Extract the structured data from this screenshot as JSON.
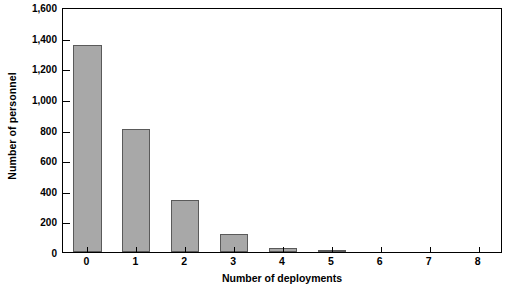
{
  "chart_data": {
    "type": "bar",
    "title": "",
    "subtitle": "",
    "xlabel": "Number of deployments",
    "ylabel": "Number of personnel",
    "categories": [
      "0",
      "1",
      "2",
      "3",
      "4",
      "5",
      "6",
      "7",
      "8"
    ],
    "values": [
      1350,
      805,
      340,
      120,
      28,
      10,
      0,
      0,
      0
    ],
    "series": [
      {
        "name": "Number of personnel",
        "values": [
          1350,
          805,
          340,
          120,
          28,
          10,
          0,
          0,
          0
        ]
      }
    ],
    "ylim": [
      0,
      1600
    ],
    "ytick_values": [
      0,
      200,
      400,
      600,
      800,
      1000,
      1200,
      1400,
      1600
    ],
    "ytick_labels": [
      "0",
      "200",
      "400",
      "600",
      "800",
      "1,000",
      "1,200",
      "1,400",
      "1,600"
    ],
    "xtick_labels": [
      "0",
      "1",
      "2",
      "3",
      "4",
      "5",
      "6",
      "7",
      "8"
    ],
    "grid": false,
    "legend": false,
    "legend_position": "none",
    "bar_color": "#a8a8a8",
    "bar_edge_color": "#5a5a5a",
    "axis_color": "#000000",
    "background_color": "#ffffff",
    "annotations": []
  }
}
